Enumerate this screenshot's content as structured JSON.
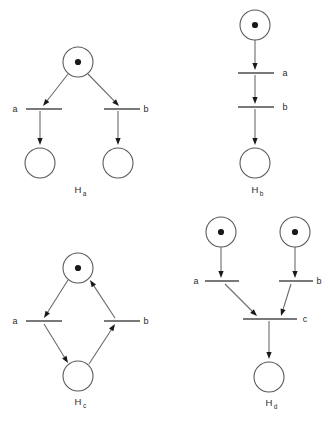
{
  "figure": {
    "background_color": "#ffffff",
    "stroke_color": "#5a5a5a",
    "token_color": "#1a1a1a",
    "label_color": "#2b2b2b",
    "width": 328,
    "height": 422
  },
  "nets": [
    {
      "id": "Ha",
      "name_main": "H",
      "name_sub": "a",
      "caption": "Ha",
      "description": "one marked place branching to two transitions a and b, each leading to its own empty place",
      "places": [
        {
          "name": "p-top",
          "cx": 78,
          "cy": 62,
          "r": 15,
          "tokens": 1
        },
        {
          "name": "p-left",
          "cx": 40,
          "cy": 163,
          "r": 15,
          "tokens": 0
        },
        {
          "name": "p-right",
          "cx": 118,
          "cy": 163,
          "r": 15,
          "tokens": 0
        }
      ],
      "transitions": [
        {
          "name": "t-a",
          "label": "a",
          "x1": 26,
          "y1": 109,
          "x2": 62,
          "y2": 109,
          "label_x": 15,
          "label_y": 112
        },
        {
          "name": "t-b",
          "label": "b",
          "x1": 104,
          "y1": 109,
          "x2": 140,
          "y2": 109,
          "label_x": 146,
          "label_y": 112
        }
      ],
      "arcs": [
        {
          "name": "arc-ptop-a",
          "x1": 68,
          "y1": 74,
          "x2": 43,
          "y2": 106,
          "head": "down-right"
        },
        {
          "name": "arc-ptop-b",
          "x1": 88,
          "y1": 74,
          "x2": 119,
          "y2": 106,
          "head": "down-left"
        },
        {
          "name": "arc-a-pleft",
          "x1": 40,
          "y1": 111,
          "x2": 40,
          "y2": 145,
          "head": "down"
        },
        {
          "name": "arc-b-pright",
          "x1": 118,
          "y1": 111,
          "x2": 118,
          "y2": 145,
          "head": "down"
        }
      ],
      "caption_x": 78,
      "caption_y": 193
    },
    {
      "id": "Hb",
      "name_main": "H",
      "name_sub": "b",
      "caption": "Hb",
      "description": "a linear chain: marked place, transition a, transition b, empty place",
      "places": [
        {
          "name": "p-top",
          "cx": 255,
          "cy": 25,
          "r": 15,
          "tokens": 1
        },
        {
          "name": "p-bottom",
          "cx": 255,
          "cy": 163,
          "r": 15,
          "tokens": 0
        }
      ],
      "transitions": [
        {
          "name": "t-a",
          "label": "a",
          "x1": 238,
          "y1": 73,
          "x2": 274,
          "y2": 73,
          "label_x": 285,
          "label_y": 76
        },
        {
          "name": "t-b",
          "label": "b",
          "x1": 238,
          "y1": 107,
          "x2": 274,
          "y2": 107,
          "label_x": 285,
          "label_y": 110
        }
      ],
      "arcs": [
        {
          "name": "arc-ptop-a",
          "x1": 255,
          "y1": 40,
          "x2": 255,
          "y2": 70,
          "head": "down"
        },
        {
          "name": "arc-a-b",
          "x1": 255,
          "y1": 75,
          "x2": 255,
          "y2": 104,
          "head": "down"
        },
        {
          "name": "arc-b-pbottom",
          "x1": 255,
          "y1": 109,
          "x2": 255,
          "y2": 145,
          "head": "down"
        }
      ],
      "caption_x": 255,
      "caption_y": 193
    },
    {
      "id": "Hc",
      "name_main": "H",
      "name_sub": "c",
      "caption": "Hc",
      "description": "a cycle: marked top place to transition a, to bottom place, to transition b, back to top place",
      "places": [
        {
          "name": "p-top",
          "cx": 78,
          "cy": 268,
          "r": 15,
          "tokens": 1
        },
        {
          "name": "p-bottom",
          "cx": 78,
          "cy": 376,
          "r": 15,
          "tokens": 0
        }
      ],
      "transitions": [
        {
          "name": "t-a",
          "label": "a",
          "x1": 26,
          "y1": 321,
          "x2": 62,
          "y2": 321,
          "label_x": 15,
          "label_y": 324
        },
        {
          "name": "t-b",
          "label": "b",
          "x1": 104,
          "y1": 321,
          "x2": 140,
          "y2": 321,
          "label_x": 146,
          "label_y": 324
        }
      ],
      "arcs": [
        {
          "name": "arc-ptop-a",
          "x1": 68,
          "y1": 280,
          "x2": 44,
          "y2": 318,
          "head": "down-right"
        },
        {
          "name": "arc-a-pbottom",
          "x1": 44,
          "y1": 324,
          "x2": 68,
          "y2": 363,
          "head": "down-left"
        },
        {
          "name": "arc-pbottom-b",
          "x1": 89,
          "y1": 364,
          "x2": 115,
          "y2": 324,
          "head": "up-right"
        },
        {
          "name": "arc-b-ptop",
          "x1": 115,
          "y1": 318,
          "x2": 90,
          "y2": 280,
          "head": "up-left"
        }
      ],
      "caption_x": 78,
      "caption_y": 405
    },
    {
      "id": "Hd",
      "name_main": "H",
      "name_sub": "d",
      "caption": "Hd",
      "description": "two marked places feed transitions a and b, whose outputs synchronize at transition c, producing one empty place",
      "places": [
        {
          "name": "p-top-left",
          "cx": 221,
          "cy": 232,
          "r": 15,
          "tokens": 1
        },
        {
          "name": "p-top-right",
          "cx": 295,
          "cy": 232,
          "r": 15,
          "tokens": 1
        },
        {
          "name": "p-bottom",
          "cx": 269,
          "cy": 377,
          "r": 15,
          "tokens": 0
        }
      ],
      "transitions": [
        {
          "name": "t-a",
          "label": "a",
          "x1": 205,
          "y1": 281,
          "x2": 239,
          "y2": 281,
          "label_x": 196,
          "label_y": 284
        },
        {
          "name": "t-b",
          "label": "b",
          "x1": 279,
          "y1": 281,
          "x2": 313,
          "y2": 281,
          "label_x": 319,
          "label_y": 284
        },
        {
          "name": "t-c",
          "label": "c",
          "x1": 243,
          "y1": 319,
          "x2": 297,
          "y2": 319,
          "label_x": 305,
          "label_y": 322
        }
      ],
      "arcs": [
        {
          "name": "arc-ptl-a",
          "x1": 221,
          "y1": 247,
          "x2": 221,
          "y2": 278,
          "head": "down"
        },
        {
          "name": "arc-ptr-b",
          "x1": 295,
          "y1": 247,
          "x2": 295,
          "y2": 278,
          "head": "down"
        },
        {
          "name": "arc-a-c",
          "x1": 225,
          "y1": 284,
          "x2": 257,
          "y2": 316,
          "head": "down-right"
        },
        {
          "name": "arc-b-c",
          "x1": 291,
          "y1": 284,
          "x2": 281,
          "y2": 316,
          "head": "down-left"
        },
        {
          "name": "arc-c-pbottom",
          "x1": 269,
          "y1": 321,
          "x2": 269,
          "y2": 359,
          "head": "down"
        }
      ],
      "caption_x": 269,
      "caption_y": 406
    }
  ]
}
